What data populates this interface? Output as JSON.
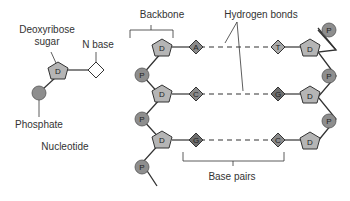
{
  "nucleotide": {
    "title": "Nucleotide",
    "sugar_label_line1": "Deoxyribose",
    "sugar_label_line2": "sugar",
    "base_label": "N base",
    "phosphate_label": "Phosphate",
    "sugar_glyph": "D"
  },
  "dna": {
    "backbone_label": "Backbone",
    "hydrogen_bonds_label": "Hydrogen bonds",
    "base_pairs_label": "Base pairs",
    "phosphate_glyph": "P",
    "sugar_glyph": "D",
    "pairs": [
      {
        "left": "A",
        "right": "T"
      },
      {
        "left": "C",
        "right": "G"
      },
      {
        "left": "G",
        "right": "C"
      }
    ]
  },
  "colors": {
    "sugar": "#b5b5b5",
    "phosphate": "#8e8e8e",
    "base_light": "#a8a8a8",
    "base_dark": "#6e6e6e",
    "line": "#333333",
    "text": "#333333"
  }
}
